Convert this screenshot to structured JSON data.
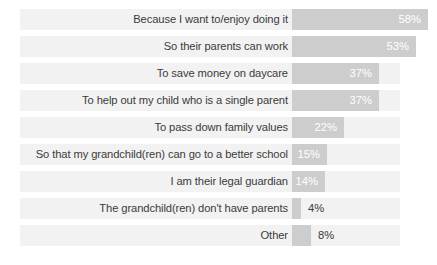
{
  "chart_data": {
    "type": "bar",
    "title": "",
    "subtitle": "",
    "xlabel": "",
    "ylabel": "",
    "orientation": "horizontal",
    "grid": false,
    "legend": "none",
    "xlim": [
      0,
      100
    ],
    "value_suffix": "%",
    "inside_label_threshold": 14,
    "categories": [
      "Because I want to/enjoy doing it",
      "So their parents can work",
      "To save money on daycare",
      "To help out my child who is a single parent",
      "To pass down family values",
      "So that my grandchild(ren) can go to a better school",
      "I am their legal guardian",
      "The grandchild(ren) don't have parents",
      "Other"
    ],
    "values": [
      58,
      53,
      37,
      37,
      22,
      15,
      14,
      4,
      8
    ],
    "value_labels": [
      "58%",
      "53%",
      "37%",
      "37%",
      "22%",
      "15%",
      "14%",
      "4%",
      "8%"
    ],
    "colors": {
      "bar_fill": "#cdcdcd",
      "track": "#f2f2f2",
      "background": "#ffffff",
      "label_text": "#3b3b3b",
      "inside_value_text": "#ffffff"
    }
  }
}
